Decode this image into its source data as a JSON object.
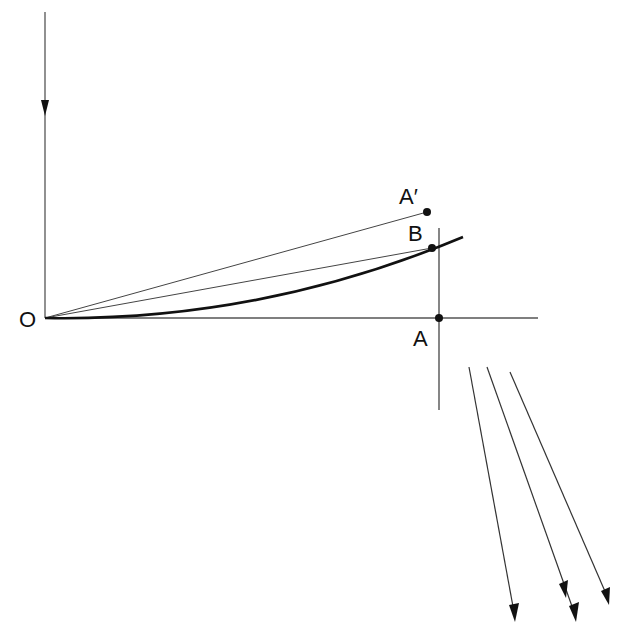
{
  "diagram": {
    "labels": {
      "origin": "O",
      "point_a": "A",
      "point_a_prime": "A′",
      "point_b": "B"
    },
    "colors": {
      "ink": "#111111",
      "thin_line": "#333333",
      "background": "#ffffff"
    },
    "points": {
      "O": [
        45,
        318
      ],
      "A": [
        439,
        318
      ],
      "A_prime": [
        427,
        212
      ],
      "B": [
        432,
        248
      ]
    },
    "elements": [
      "vertical arrow down at left",
      "horizontal axis through O and A",
      "vertical line through A",
      "straight line O to A'",
      "straight line O to B",
      "curved path from O through B",
      "three parallel downward arrows at lower right"
    ]
  }
}
